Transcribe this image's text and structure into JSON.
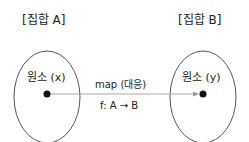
{
  "diagram": {
    "set_a": {
      "title": "[집합 A]",
      "element": "원소 (x)"
    },
    "set_b": {
      "title": "[집합 B]",
      "element": "원소 (y)"
    },
    "mapping": {
      "label": "map (대응)",
      "function": "f: A → B"
    },
    "colors": {
      "stroke": "#555555",
      "dot": "#111111",
      "arrow": "#999999",
      "text": "#222222"
    }
  }
}
